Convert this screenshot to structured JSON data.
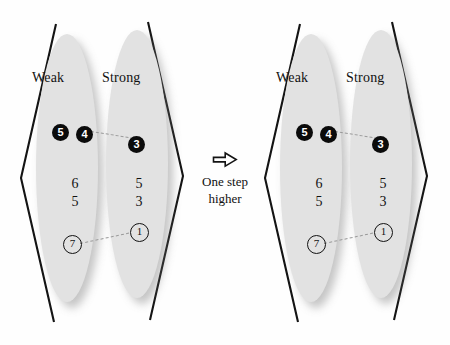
{
  "figure": {
    "panels": [
      {
        "id": "before",
        "columns": [
          {
            "id": "weak",
            "title": "Weak",
            "filled_circles": [
              "5",
              "4"
            ],
            "plain_numbers": [
              "6",
              "5"
            ],
            "ring_numbers": [
              "7"
            ]
          },
          {
            "id": "strong",
            "title": "Strong",
            "filled_circles": [
              "3"
            ],
            "plain_numbers": [
              "5",
              "3"
            ],
            "ring_numbers": [
              "1"
            ]
          }
        ]
      },
      {
        "id": "after",
        "columns": [
          {
            "id": "weak",
            "title": "Weak",
            "filled_circles": [
              "5",
              "4"
            ],
            "plain_numbers": [
              "6",
              "5"
            ],
            "ring_numbers": [
              "7"
            ]
          },
          {
            "id": "strong",
            "title": "Strong",
            "filled_circles": [
              "3"
            ],
            "plain_numbers": [
              "5",
              "3"
            ],
            "ring_numbers": [
              "1"
            ]
          }
        ]
      }
    ],
    "transition": {
      "arrow_icon": "hollow-right-arrow-icon",
      "caption_line1": "One step",
      "caption_line2": "higher"
    },
    "colors": {
      "ellipse_fill": "#e2e2e2",
      "filled_circle": "#0b0b0b",
      "filled_circle_text": "#ffffff",
      "ink": "#121212",
      "connector": "#9a9a9a",
      "background": "#fefefe"
    }
  }
}
